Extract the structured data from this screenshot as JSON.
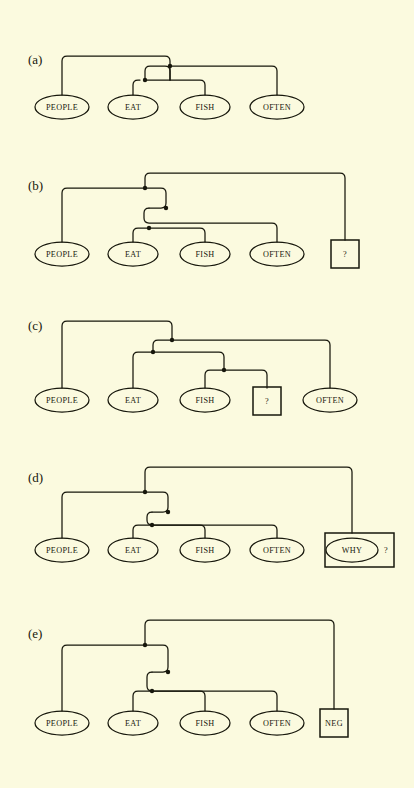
{
  "figure": {
    "background_color": "#fbfadf",
    "ink_color": "#17170c",
    "caption_style": "parenthesized-letter"
  },
  "panels": [
    {
      "id": "a",
      "label": "(a)",
      "label_x": 28,
      "label_y": 60,
      "baseline_y": 107,
      "nodes": [
        {
          "id": "people",
          "type": "ellipse",
          "label": "PEOPLE",
          "cx": 62,
          "cy": 107,
          "rx": 27,
          "ry": 12
        },
        {
          "id": "eat",
          "type": "ellipse",
          "label": "EAT",
          "cx": 133,
          "cy": 107,
          "rx": 25,
          "ry": 12
        },
        {
          "id": "fish",
          "type": "ellipse",
          "label": "FISH",
          "cx": 205,
          "cy": 107,
          "rx": 25,
          "ry": 12
        },
        {
          "id": "often",
          "type": "ellipse",
          "label": "OFTEN",
          "cx": 277,
          "cy": 107,
          "rx": 27,
          "ry": 12
        }
      ],
      "junctions": [
        {
          "id": "j-top",
          "x": 170,
          "y": 60
        },
        {
          "id": "j-mid",
          "x": 145,
          "y": 80
        }
      ]
    },
    {
      "id": "b",
      "label": "(b)",
      "label_x": 28,
      "label_y": 185,
      "baseline_y": 254,
      "nodes": [
        {
          "id": "people",
          "type": "ellipse",
          "label": "PEOPLE",
          "cx": 62,
          "cy": 254,
          "rx": 27,
          "ry": 12
        },
        {
          "id": "eat",
          "type": "ellipse",
          "label": "EAT",
          "cx": 133,
          "cy": 254,
          "rx": 25,
          "ry": 12
        },
        {
          "id": "fish",
          "type": "ellipse",
          "label": "FISH",
          "cx": 205,
          "cy": 254,
          "rx": 25,
          "ry": 12
        },
        {
          "id": "often",
          "type": "ellipse",
          "label": "OFTEN",
          "cx": 277,
          "cy": 254,
          "rx": 27,
          "ry": 12
        },
        {
          "id": "query",
          "type": "box",
          "label": "?",
          "cx": 345,
          "cy": 254,
          "w": 28,
          "h": 28
        }
      ],
      "junctions": [
        {
          "id": "j-root",
          "x": 145,
          "y": 188
        },
        {
          "id": "j-top",
          "x": 166,
          "y": 208
        },
        {
          "id": "j-mid",
          "x": 149,
          "y": 228
        }
      ]
    },
    {
      "id": "c",
      "label": "(c)",
      "label_x": 28,
      "label_y": 325,
      "baseline_y": 400,
      "nodes": [
        {
          "id": "people",
          "type": "ellipse",
          "label": "PEOPLE",
          "cx": 62,
          "cy": 400,
          "rx": 27,
          "ry": 12
        },
        {
          "id": "eat",
          "type": "ellipse",
          "label": "EAT",
          "cx": 133,
          "cy": 400,
          "rx": 25,
          "ry": 12
        },
        {
          "id": "fish",
          "type": "ellipse",
          "label": "FISH",
          "cx": 205,
          "cy": 400,
          "rx": 25,
          "ry": 12
        },
        {
          "id": "query",
          "type": "box",
          "label": "?",
          "cx": 267,
          "cy": 400,
          "w": 28,
          "h": 28
        },
        {
          "id": "often",
          "type": "ellipse",
          "label": "OFTEN",
          "cx": 330,
          "cy": 400,
          "rx": 27,
          "ry": 12
        }
      ],
      "junctions": [
        {
          "id": "j-top",
          "x": 172,
          "y": 340
        },
        {
          "id": "j-mid",
          "x": 153,
          "y": 352
        },
        {
          "id": "j-low",
          "x": 224,
          "y": 370
        }
      ]
    },
    {
      "id": "d",
      "label": "(d)",
      "label_x": 28,
      "label_y": 477,
      "baseline_y": 550,
      "nodes": [
        {
          "id": "people",
          "type": "ellipse",
          "label": "PEOPLE",
          "cx": 62,
          "cy": 550,
          "rx": 27,
          "ry": 12
        },
        {
          "id": "eat",
          "type": "ellipse",
          "label": "EAT",
          "cx": 133,
          "cy": 550,
          "rx": 25,
          "ry": 12
        },
        {
          "id": "fish",
          "type": "ellipse",
          "label": "FISH",
          "cx": 205,
          "cy": 550,
          "rx": 25,
          "ry": 12
        },
        {
          "id": "often",
          "type": "ellipse",
          "label": "OFTEN",
          "cx": 277,
          "cy": 550,
          "rx": 27,
          "ry": 12
        },
        {
          "id": "why",
          "type": "ellipse",
          "label": "WHY",
          "cx": 352,
          "cy": 550,
          "rx": 26,
          "ry": 12
        }
      ],
      "group_box": {
        "id": "why-group",
        "x": 325,
        "y": 533,
        "w": 69,
        "h": 34,
        "marker": "?",
        "marker_x": 386,
        "marker_y": 551
      },
      "junctions": [
        {
          "id": "j-root",
          "x": 145,
          "y": 492
        },
        {
          "id": "j-top",
          "x": 168,
          "y": 512
        },
        {
          "id": "j-mid",
          "x": 152,
          "y": 525
        }
      ]
    },
    {
      "id": "e",
      "label": "(e)",
      "label_x": 28,
      "label_y": 633,
      "baseline_y": 723,
      "nodes": [
        {
          "id": "people",
          "type": "ellipse",
          "label": "PEOPLE",
          "cx": 62,
          "cy": 723,
          "rx": 27,
          "ry": 12
        },
        {
          "id": "eat",
          "type": "ellipse",
          "label": "EAT",
          "cx": 133,
          "cy": 723,
          "rx": 25,
          "ry": 12
        },
        {
          "id": "fish",
          "type": "ellipse",
          "label": "FISH",
          "cx": 205,
          "cy": 723,
          "rx": 25,
          "ry": 12
        },
        {
          "id": "often",
          "type": "ellipse",
          "label": "OFTEN",
          "cx": 277,
          "cy": 723,
          "rx": 27,
          "ry": 12
        },
        {
          "id": "neg",
          "type": "box",
          "label": "NEG",
          "cx": 334,
          "cy": 723,
          "w": 28,
          "h": 28
        }
      ],
      "junctions": [
        {
          "id": "j-root",
          "x": 145,
          "y": 645
        },
        {
          "id": "j-top",
          "x": 168,
          "y": 672
        },
        {
          "id": "j-mid",
          "x": 152,
          "y": 691
        }
      ]
    }
  ],
  "paths": {
    "a": [
      "M62,95 L62,60 Q62,56 66,56 L166,56 Q170,56 170,60 L170,80",
      "M145,80 Q145,76 149,76 L273,76 Q277,76 277,80 L277,95",
      "M133,95 L133,84 Q133,80 137,80 L201,80 Q205,80 205,84 L205,95",
      "M145,80 L145,72 Q145,68 149,68 L166,68 Q170,68 170,72 L170,80"
    ],
    "a_note": "rendered via generic link list below",
    "b": [],
    "c": [],
    "d": [],
    "e": []
  },
  "links": {
    "a": [
      {
        "from": "people",
        "to": "j-top",
        "shape": "up-over"
      },
      {
        "from": "j-mid",
        "to": "often",
        "shape": "over-down"
      },
      {
        "from": "eat",
        "to": "fish",
        "shape": "up-over-down"
      },
      {
        "from": "j-mid",
        "to": "j-top",
        "shape": "riser"
      }
    ]
  },
  "legend": {
    "ellipse_meaning": "lexical word node",
    "box_meaning": "abstract / functional node",
    "dot_meaning": "link junction"
  }
}
